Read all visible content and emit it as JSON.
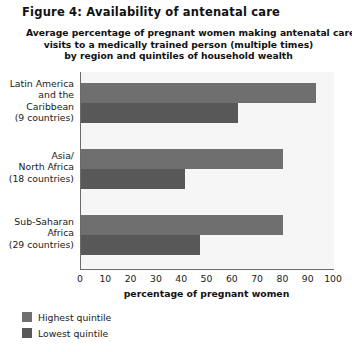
{
  "figure": {
    "title": "Figure 4: Availability of antenatal care"
  },
  "chart_data": {
    "type": "bar",
    "orientation": "horizontal",
    "title": "Average percentage of pregnant women making antenatal care visits to a medically trained person (multiple times) by region and quintiles of household wealth",
    "title_lines": [
      "Average percentage of pregnant women making antenatal care",
      "visits to a medically trained person (multiple times)",
      "by region and quintiles of household wealth"
    ],
    "categories": [
      "Latin America and the Caribbean (9 countries)",
      "Asia/ North Africa (18 countries)",
      "Sub-Saharan Africa (29 countries)"
    ],
    "category_lines": [
      [
        "Latin America",
        "and the",
        "Caribbean",
        "(9 countries)"
      ],
      [
        "Asia/",
        "North Africa",
        "(18 countries)"
      ],
      [
        "Sub-Saharan",
        "Africa",
        "(29 countries)"
      ]
    ],
    "series": [
      {
        "name": "Highest quintile",
        "color": "#6f6f6f",
        "values": [
          93,
          80,
          80
        ]
      },
      {
        "name": "Lowest quintile",
        "color": "#585858",
        "values": [
          62,
          41,
          47
        ]
      }
    ],
    "xlabel": "percentage of pregnant women",
    "ylabel": "",
    "xlim": [
      0,
      100
    ],
    "xticks": [
      0,
      10,
      20,
      30,
      40,
      50,
      60,
      70,
      80,
      90,
      100
    ],
    "grid": false,
    "legend_position": "below-left",
    "plot_background": "#f6f6f6",
    "axis_color": "#6b6b6b"
  }
}
